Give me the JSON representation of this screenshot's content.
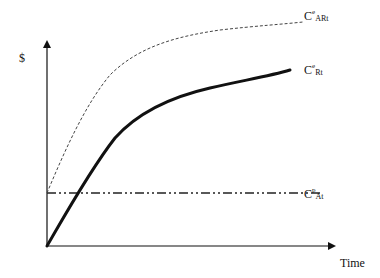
{
  "diagram": {
    "y_axis_label": "$",
    "x_axis_label": "Time",
    "curves": [
      {
        "id": "C_ARt",
        "base": "C",
        "superscript": "e",
        "subscript": "ARt",
        "style": "dotted",
        "description": "upper concave curve starting at the horizontal line level"
      },
      {
        "id": "C_Rt",
        "base": "C",
        "superscript": "e",
        "subscript": "Rt",
        "style": "thick solid",
        "description": "concave curve starting at origin"
      },
      {
        "id": "C_At",
        "base": "C",
        "superscript": "p",
        "subscript": "At",
        "style": "dash-dot",
        "description": "horizontal constant line"
      }
    ],
    "colors": {
      "line": "#111111",
      "dotted": "#555555",
      "background": "#ffffff"
    }
  }
}
